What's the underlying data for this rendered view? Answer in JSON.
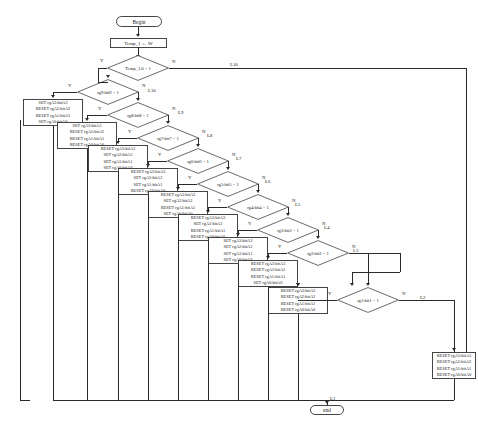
{
  "diagram": {
    "start_label": "Begin",
    "end_label": "end",
    "assign_label": "Temp_1 ← W",
    "yes_label": "Y",
    "no_label": "N",
    "end_flow_label": "L1",
    "steps": [
      {
        "id": "d10",
        "condition": "Temp_1.0 = 1",
        "no_label": "L10",
        "actions": [
          "SET rgA3:bitA3",
          "RESET rgA2:bitA2",
          "RESET rgA1:bitA1",
          "SET rgA0:bitA0"
        ]
      },
      {
        "id": "d9",
        "condition": "rg9:bit9 = 1",
        "no_label": "L10",
        "actions": [
          "SET rgA3:bitA3",
          "RESET rgA2:bitA2",
          "RESET rgA1:bitA1",
          "SET rgA0:bitA0"
        ]
      },
      {
        "id": "d8",
        "condition": "rg8:bit8 = 1",
        "no_label": "L9",
        "actions": [
          "SET rgA3:bitA3",
          "RESET rgA2:bitA2",
          "RESET rgA1:bitA1",
          "RESET rgA0:bitA0"
        ]
      },
      {
        "id": "d7",
        "condition": "rg7:bit7 = 1",
        "no_label": "L8",
        "actions": [
          "RESET rgA3:bitA3",
          "SET rgA2:bitA2",
          "SET rgA1:bitA1",
          "SET rgA0:bitA0"
        ]
      },
      {
        "id": "d6",
        "condition": "rg6:bit6 = 1",
        "no_label": "L7",
        "actions": [
          "RESET rgA3:bitA3",
          "SET rgA2:bitA2",
          "SET rgA1:bitA1",
          "RESET rgA0:bitA0"
        ]
      },
      {
        "id": "d5",
        "condition": "rg5:bit5 = 1",
        "no_label": "L6",
        "actions": [
          "RESET rgA3:bitA3",
          "SET rgA2:bitA2",
          "RESET rgA1:bitA1",
          "SET rgA0:bitA0"
        ]
      },
      {
        "id": "d4",
        "condition": "rg4:bit4 = 1",
        "no_label": "L5",
        "actions": [
          "RESET rgA3:bitA3",
          "SET rgA2:bitA2",
          "RESET rgA1:bitA1",
          "RESET rgA0:bitA0"
        ]
      },
      {
        "id": "d3",
        "condition": "rg3:bit3 = 1",
        "no_label": "L4",
        "actions": [
          "SET rgA3:bitA3",
          "SET rgA2:bitA2",
          "SET rgA1:bitA1",
          "SET rgA0:bitA0"
        ]
      },
      {
        "id": "d2",
        "condition": "rg2:bit2 = 1",
        "no_label": "L3",
        "actions": [
          "RESET rgA3:bitA3",
          "RESET rgA2:bitA2",
          "RESET rgA1:bitA1",
          "SET rgA0:bitA0"
        ]
      },
      {
        "id": "d1",
        "condition": "rg1:bit1 = 1",
        "no_label": "L2",
        "actions": [
          "RESET rgA3:bitA3",
          "RESET rgA2:bitA2",
          "RESET rgA1:bitA1",
          "RESET rgA0:bitA0"
        ]
      }
    ],
    "final_actions": [
      "RESET rgA3:bitA3",
      "RESET rgA2:bitA2",
      "RESET rgA1:bitA1",
      "RESET rgA0:bitA0"
    ],
    "colors": {
      "line": "#2a2a2a",
      "border": "#444444",
      "text": "#1a1a1a",
      "background": "#fefefe"
    }
  }
}
